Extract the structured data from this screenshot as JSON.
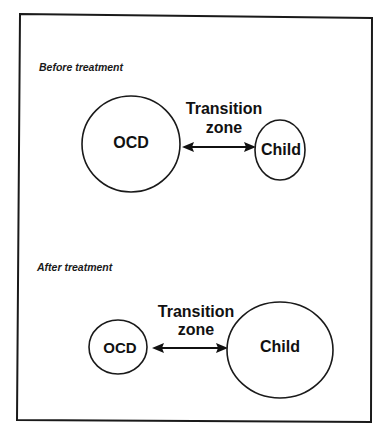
{
  "diagram": {
    "type": "before-after concept diagram",
    "border_color": "#1a1a1a",
    "panels": [
      {
        "id": "before",
        "label": "Before treatment",
        "nodes": [
          {
            "id": "ocd",
            "label": "OCD",
            "size": "large"
          },
          {
            "id": "child",
            "label": "Child",
            "size": "small"
          }
        ],
        "connector": {
          "type": "bidirectional-arrow",
          "from": "ocd",
          "to": "child",
          "label_line1": "Transition",
          "label_line2": "zone"
        }
      },
      {
        "id": "after",
        "label": "After treatment",
        "nodes": [
          {
            "id": "ocd",
            "label": "OCD",
            "size": "small"
          },
          {
            "id": "child",
            "label": "Child",
            "size": "large"
          }
        ],
        "connector": {
          "type": "bidirectional-arrow",
          "from": "ocd",
          "to": "child",
          "label_line1": "Transition",
          "label_line2": "zone"
        }
      }
    ]
  }
}
